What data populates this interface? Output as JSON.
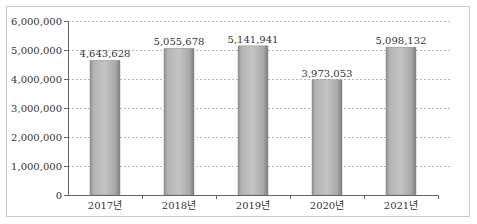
{
  "chart_data": {
    "type": "bar",
    "title": "",
    "xlabel": "",
    "ylabel": "",
    "categories": [
      "2017년",
      "2018년",
      "2019년",
      "2020년",
      "2021년"
    ],
    "values": [
      4643628,
      5055678,
      5141941,
      3973053,
      5098132
    ],
    "data_labels": [
      "4,643,628",
      "5,055,678",
      "5,141,941",
      "3,973,053",
      "5,098,132"
    ],
    "ylim": [
      0,
      6000000
    ],
    "yticks": [
      0,
      1000000,
      2000000,
      3000000,
      4000000,
      5000000,
      6000000
    ],
    "ytick_labels": [
      "0",
      "1,000,000",
      "2,000,000",
      "3,000,000",
      "4,000,000",
      "5,000,000",
      "6,000,000"
    ],
    "grid": true,
    "grid_style": "dashed",
    "legend": "none",
    "bar_color": "#a6a6a6"
  }
}
